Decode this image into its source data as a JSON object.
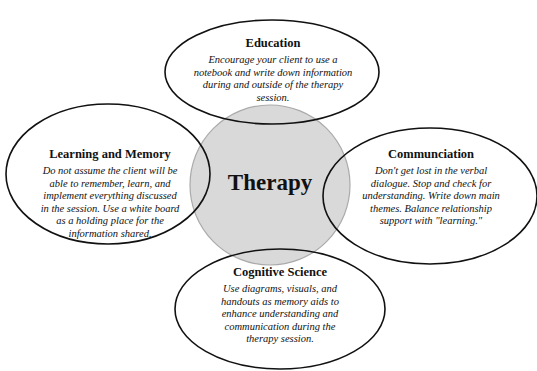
{
  "center": {
    "label": "Therapy",
    "fill": "#d9d9d9",
    "stroke": "#b0b0b0"
  },
  "nodes": [
    {
      "id": "education",
      "title": "Education",
      "description": "Encourage your client to use a notebook and write down information during and outside of the therapy session."
    },
    {
      "id": "learning-memory",
      "title": "Learning and Memory",
      "description": "Do not assume the client will be able to remember, learn, and implement everything discussed in the session. Use a white board as a holding place for the information shared."
    },
    {
      "id": "communication",
      "title": "Communciation",
      "description": "Don't get lost in the verbal dialogue. Stop and check for understanding. Write down main themes. Balance relationship support with \"learning.\""
    },
    {
      "id": "cognitive-science",
      "title": "Cognitive Science",
      "description": "Use diagrams, visuals, and handouts as memory aids to enhance understanding and communication during the therapy session."
    }
  ]
}
